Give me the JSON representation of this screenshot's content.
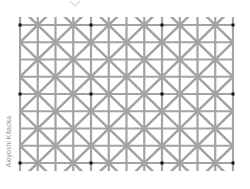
{
  "figure": {
    "credit": "Akiyoshi Kitaoka",
    "grid": {
      "x0": 20,
      "x1": 233,
      "cols": 12,
      "y0": 25,
      "y1": 163,
      "rows": 8,
      "line_color": "#a3a3a3",
      "line_width": 2.2
    },
    "dots": {
      "color": "#111111",
      "size": 3,
      "col_step": 4,
      "row_step": 4
    },
    "chevron_color": "#dcdcdc"
  }
}
